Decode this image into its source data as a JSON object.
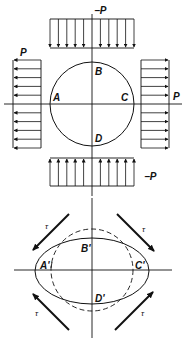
{
  "colors": {
    "background": "#ffffff",
    "ink": "#111111"
  },
  "top_figure": {
    "description": "Circle under biaxial loading: tension P on left/right faces, compression -P on top/bottom faces",
    "points": {
      "A": "A",
      "B": "B",
      "C": "C",
      "D": "D"
    },
    "loads": {
      "top": "−P",
      "bottom": "−P",
      "left": "P",
      "right": "P"
    }
  },
  "bottom_figure": {
    "description": "Deformed shape: circle (dashed) becomes ellipse under pure shear τ",
    "points": {
      "A": "A'",
      "B": "B'",
      "C": "C'",
      "D": "D'"
    },
    "shear_label": "τ",
    "shear_arrows": [
      "upper-left",
      "upper-right",
      "lower-left",
      "lower-right"
    ]
  }
}
